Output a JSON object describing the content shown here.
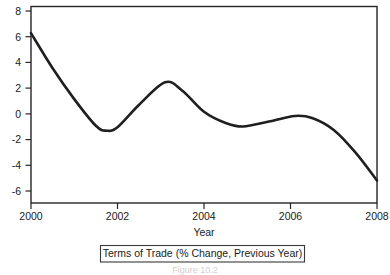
{
  "chart_data": {
    "type": "line",
    "title": "",
    "subtitle": "",
    "xlabel": "Year",
    "ylabel": "",
    "xlim": [
      2000,
      2008
    ],
    "ylim": [
      -6,
      8
    ],
    "grid": false,
    "legend_position": "bottom",
    "legend": [
      "Terms of Trade (% Change, Previous Year)"
    ],
    "xticks": [
      2000,
      2002,
      2004,
      2006,
      2008
    ],
    "xticklabels": [
      "2000",
      "2002",
      "2004",
      "2006",
      "2008"
    ],
    "yticks": [
      8,
      6,
      4,
      2,
      0,
      -2,
      -4,
      -6
    ],
    "yticklabels": [
      "8",
      "6",
      "4",
      "2",
      "0",
      "-2",
      "-4",
      "-6"
    ],
    "series": [
      {
        "name": "Terms of Trade (% Change, Previous Year)",
        "color": "#1f1f1f",
        "x": [
          2000.0,
          2000.5,
          2001.0,
          2001.5,
          2001.75,
          2002.0,
          2002.5,
          2003.1,
          2003.5,
          2004.0,
          2004.5,
          2004.9,
          2005.5,
          2006.1,
          2006.5,
          2007.0,
          2007.5,
          2008.0
        ],
        "values": [
          6.1,
          3.6,
          1.4,
          -0.5,
          -0.85,
          -0.6,
          1.0,
          2.6,
          2.0,
          0.5,
          -0.3,
          -0.55,
          -0.2,
          0.2,
          0.05,
          -0.8,
          -2.4,
          -4.4
        ]
      }
    ],
    "annotations": {
      "start_value": 6.1,
      "first_trough": {
        "x": 2001.75,
        "y": -0.85
      },
      "peak": {
        "x": 2003.1,
        "y": 2.6
      },
      "second_trough": {
        "x": 2004.9,
        "y": -0.55
      },
      "second_peak": {
        "x": 2006.1,
        "y": 0.2
      },
      "end_value": -4.4
    }
  },
  "figure": {
    "caption": "Figure 10.2"
  }
}
